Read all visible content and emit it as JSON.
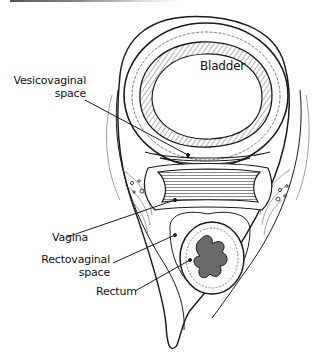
{
  "figure": {
    "labels": {
      "bladder": "Bladder",
      "vesicovaginal_1": "Vesicovaginal",
      "vesicovaginal_2": "space",
      "vagina": "Vagina",
      "rectovaginal_1": "Rectovaginal",
      "rectovaginal_2": "space",
      "rectum": "Rectum"
    }
  },
  "colors": {
    "line": "#1a1a1a",
    "hatch": "#555555",
    "lumen_fill": "#6a6a6a",
    "background": "#ffffff"
  }
}
